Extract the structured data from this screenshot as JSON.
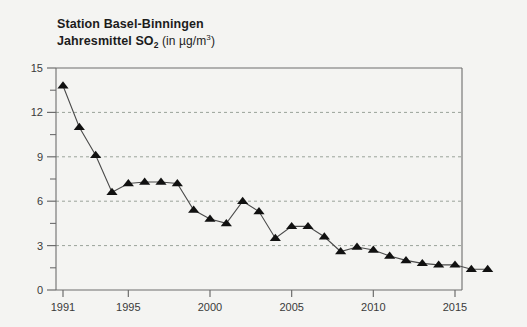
{
  "title": {
    "line1": "Station Basel-Binningen",
    "line2_main": "Jahresmittel SO",
    "line2_sub": "2",
    "line2_unit": "(in µg/m",
    "line2_unit_sup": "3",
    "line2_unit_close": ")"
  },
  "chart_data": {
    "type": "line",
    "title": "Station Basel-Binningen Jahresmittel SO2 (in µg/m3)",
    "xlabel": "",
    "ylabel": "",
    "xlim": [
      1990.4,
      1917.6
    ],
    "ylim": [
      0,
      15
    ],
    "yticks": [
      0,
      3,
      6,
      9,
      12,
      15
    ],
    "yticklabels": [
      "0",
      "3",
      "6",
      "9",
      "12",
      "15"
    ],
    "yminorticks": [
      1.5,
      4.5,
      7.5,
      10.5,
      13.5
    ],
    "xticks": [
      1991,
      1995,
      2000,
      2005,
      2010,
      2015
    ],
    "xticklabels": [
      "1991",
      "1995",
      "2000",
      "2005",
      "2010",
      "2015"
    ],
    "grid": "horizontal-dashed",
    "legend": "none",
    "marker": "triangle-up",
    "marker_color": "#111111",
    "line_color": "#4a4a4a",
    "x": [
      1991,
      1992,
      1993,
      1994,
      1995,
      1996,
      1997,
      1998,
      1999,
      2000,
      2001,
      2002,
      2003,
      2004,
      2005,
      2006,
      2007,
      2008,
      2009,
      2010,
      2011,
      2012,
      2013,
      2014,
      2015,
      2016,
      2017
    ],
    "values": [
      13.8,
      11.0,
      9.1,
      6.6,
      7.2,
      7.3,
      7.3,
      7.2,
      5.4,
      4.8,
      4.5,
      6.0,
      5.3,
      3.5,
      4.3,
      4.3,
      3.6,
      2.6,
      2.9,
      2.7,
      2.3,
      2.0,
      1.8,
      1.7,
      1.7,
      1.4,
      1.4
    ]
  },
  "colors": {
    "background": "#f4f4f2",
    "plot_border": "#6d6d6d",
    "gridline": "#9aa39a",
    "text": "#3a3a3a"
  }
}
